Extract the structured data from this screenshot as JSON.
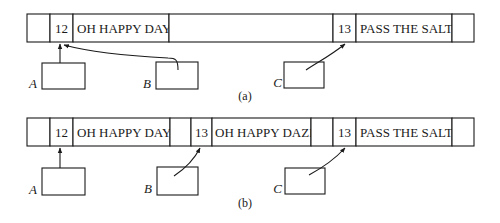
{
  "diagram": {
    "panel_a": {
      "caption": "(a)",
      "cells": [
        {
          "kind": "empty"
        },
        {
          "kind": "count",
          "text": "12"
        },
        {
          "kind": "string",
          "text": "OH HAPPY DAY"
        },
        {
          "kind": "empty"
        },
        {
          "kind": "count",
          "text": "13"
        },
        {
          "kind": "string",
          "text": "PASS THE SALT"
        },
        {
          "kind": "empty"
        }
      ],
      "pointers": [
        {
          "label": "A",
          "target": "12"
        },
        {
          "label": "B",
          "target": "12"
        },
        {
          "label": "C",
          "target": "13"
        }
      ]
    },
    "panel_b": {
      "caption": "(b)",
      "cells": [
        {
          "kind": "empty"
        },
        {
          "kind": "count",
          "text": "12"
        },
        {
          "kind": "string",
          "text": "OH HAPPY DAY"
        },
        {
          "kind": "empty"
        },
        {
          "kind": "count",
          "text": "13"
        },
        {
          "kind": "string",
          "text": "OH HAPPY DAZE"
        },
        {
          "kind": "empty"
        },
        {
          "kind": "count",
          "text": "13"
        },
        {
          "kind": "string",
          "text": "PASS THE SALT"
        },
        {
          "kind": "empty"
        }
      ],
      "pointers": [
        {
          "label": "A",
          "target": "12"
        },
        {
          "label": "B",
          "target": "13"
        },
        {
          "label": "C",
          "target": "13"
        }
      ]
    }
  }
}
